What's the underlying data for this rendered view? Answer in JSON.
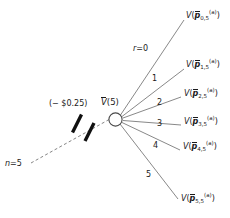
{
  "diagram": {
    "type": "scenario-tree",
    "background_color": "#ffffff",
    "line_color": "#555555",
    "text_color": "#1a1a1a",
    "node": {
      "label_V": "V",
      "label_paren": "(5)",
      "full_label": "V(5)"
    },
    "incoming": {
      "stage_label_n": "n",
      "stage_label_eq": "=",
      "stage_label_value": "5",
      "stage_label_full": "n = 5",
      "cost_label": "(− $0.25)",
      "style": "dashed",
      "tick_marks": 2
    },
    "first_branch": {
      "r_symbol": "r",
      "r_eq": "=",
      "r_value": "0",
      "full": "r = 0"
    },
    "branches": [
      {
        "index": "0",
        "index_label": "r = 0",
        "terminal": {
          "func": "V",
          "vector": "p",
          "subscript": "0,5",
          "superscript": "(a)",
          "full": "V(p0,5(a))"
        }
      },
      {
        "index": "1",
        "index_label": "1",
        "terminal": {
          "func": "V",
          "vector": "p",
          "subscript": "1,5",
          "superscript": "(a)",
          "full": "V(p1,5(a))"
        }
      },
      {
        "index": "2",
        "index_label": "2",
        "terminal": {
          "func": "V",
          "vector": "p",
          "subscript": "2,5",
          "superscript": "(a)",
          "full": "V(p2,5(a))"
        }
      },
      {
        "index": "3",
        "index_label": "3",
        "terminal": {
          "func": "V",
          "vector": "p",
          "subscript": "3,5",
          "superscript": "(a)",
          "full": "V(p3,5(a))"
        }
      },
      {
        "index": "4",
        "index_label": "4",
        "terminal": {
          "func": "V",
          "vector": "p",
          "subscript": "4,5",
          "superscript": "(a)",
          "full": "V(p4,5(a))"
        }
      },
      {
        "index": "5",
        "index_label": "5",
        "terminal": {
          "func": "V",
          "vector": "p",
          "subscript": "5,5",
          "superscript": "(a)",
          "full": "V(p5,5(a))"
        }
      }
    ]
  }
}
